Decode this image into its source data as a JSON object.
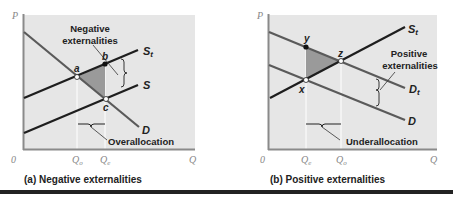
{
  "colors": {
    "plot_bg": "#e6e6e6",
    "axis": "#8a8a8a",
    "supply_line": "#1e1e1e",
    "demand_line": "#5a5a5a",
    "shaded_area": "#9a9a9a",
    "guide_line": "#ffffff",
    "text": "#222222",
    "axis_text": "#888888"
  },
  "panels": [
    {
      "id": "a",
      "caption": "(a) Negative externalities",
      "y_axis_label": "P",
      "x_axis_label": "Q",
      "origin_label": "0",
      "ticks": [
        "Qo",
        "Qe"
      ],
      "tick_q_o": "Q",
      "tick_q_o_sub": "o",
      "tick_q_e": "Q",
      "tick_q_e_sub": "e",
      "curves": {
        "st": "S",
        "st_sub": "t",
        "s": "S",
        "d": "D"
      },
      "points": {
        "a": "a",
        "b": "b",
        "c": "c"
      },
      "annotation_line1": "Negative",
      "annotation_line2": "externalities",
      "bracket_label": "Overallocation"
    },
    {
      "id": "b",
      "caption": "(b) Positive externalities",
      "y_axis_label": "P",
      "x_axis_label": "Q",
      "origin_label": "0",
      "tick_q_e": "Q",
      "tick_q_e_sub": "e",
      "tick_q_o": "Q",
      "tick_q_o_sub": "o",
      "curves": {
        "st": "S",
        "st_sub": "t",
        "dt": "D",
        "dt_sub": "t",
        "d": "D"
      },
      "points": {
        "y": "y",
        "z": "z",
        "x": "x"
      },
      "annotation_line1": "Positive",
      "annotation_line2": "externalities",
      "bracket_label": "Underallocation"
    }
  ]
}
